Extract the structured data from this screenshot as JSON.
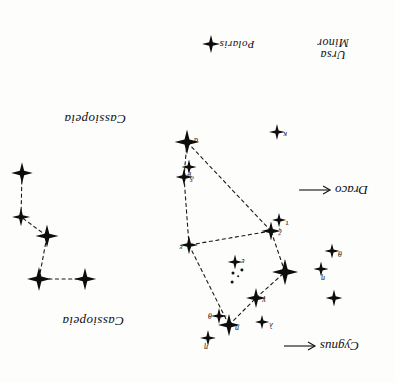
{
  "chart_data": {
    "type": "scatter",
    "orientation_note": "plate printed upside-down (rotated 180 degrees)",
    "xlim": [
      0,
      395
    ],
    "ylim": [
      0,
      382
    ],
    "grid": false,
    "legend_position": "bottom",
    "constellation_labels": [
      {
        "name": "Cassiopeia",
        "x": 302,
        "y": 61,
        "size": 13
      },
      {
        "name": "Cassiopeia",
        "x": 300,
        "y": 263,
        "size": 13
      },
      {
        "name": "Polaris",
        "x": 158,
        "y": 338,
        "size": 11
      },
      {
        "name": "Ursa Minor",
        "line1": "Ursa",
        "line2": "Minor",
        "x": 62,
        "y": 333,
        "size": 12
      }
    ],
    "direction_markers": [
      {
        "name": "Cygnus",
        "x": 74,
        "y": 36,
        "size": 13
      },
      {
        "name": "Draco",
        "x": 62,
        "y": 192,
        "size": 13
      }
    ],
    "legend_items": [
      {
        "label": "Polaris",
        "symbol": "four-point-star"
      }
    ],
    "series": [
      {
        "name": "Ursa Minor",
        "stars": [
          {
            "id": "um-polaris",
            "label": "α",
            "x": 208,
            "y": 240,
            "mag": 4.2,
            "label_dx": -9,
            "label_dy": 2
          },
          {
            "id": "um-delta",
            "label": "δ",
            "x": 211,
            "y": 205,
            "mag": 2.2,
            "label_dx": -8,
            "label_dy": -1
          },
          {
            "id": "um-epsilon",
            "label": "ε",
            "x": 206,
            "y": 137,
            "mag": 2.6,
            "label_dx": 8,
            "label_dy": -2
          },
          {
            "id": "um-zeta",
            "label": "ζ",
            "x": 124,
            "y": 151,
            "mag": 2.8,
            "label_dx": -9,
            "label_dy": 0
          },
          {
            "id": "um-beta",
            "label": "β",
            "x": 110,
            "y": 110,
            "mag": 4.6,
            "label_dx": 0,
            "label_dy": 0
          },
          {
            "id": "um-gamma",
            "label": "γ",
            "x": 139,
            "y": 84,
            "mag": 3.0,
            "label_dx": -8,
            "label_dy": -2
          },
          {
            "id": "um-eta2",
            "label": "η",
            "x": 166,
            "y": 57,
            "mag": 3.6,
            "label_dx": -8,
            "label_dy": -3
          }
        ],
        "connections": [
          [
            "um-polaris",
            "um-delta"
          ],
          [
            "um-delta",
            "um-epsilon"
          ],
          [
            "um-epsilon",
            "um-eta2"
          ],
          [
            "um-eta2",
            "um-gamma"
          ],
          [
            "um-gamma",
            "um-beta"
          ],
          [
            "um-beta",
            "um-zeta"
          ],
          [
            "um-zeta",
            "um-epsilon"
          ],
          [
            "um-zeta",
            "um-polaris"
          ]
        ]
      },
      {
        "name": "Cassiopeia",
        "stars": [
          {
            "id": "ca-1",
            "x": 310,
            "y": 103,
            "mag": 3.6
          },
          {
            "id": "ca-2",
            "x": 356,
            "y": 103,
            "mag": 4.0
          },
          {
            "id": "ca-3",
            "x": 348,
            "y": 146,
            "mag": 3.8
          },
          {
            "id": "ca-4",
            "x": 374,
            "y": 165,
            "mag": 2.6
          },
          {
            "id": "ca-5",
            "x": 373,
            "y": 209,
            "mag": 3.4
          }
        ],
        "connections": [
          [
            "ca-1",
            "ca-2"
          ],
          [
            "ca-2",
            "ca-3"
          ],
          [
            "ca-3",
            "ca-4"
          ],
          [
            "ca-4",
            "ca-5"
          ]
        ]
      },
      {
        "name": "field stars",
        "stars": [
          {
            "id": "fs-1",
            "label": "θ",
            "x": 176,
            "y": 66,
            "mag": 2.0,
            "label_dx": 9,
            "label_dy": 1
          },
          {
            "id": "fs-2",
            "label": "η",
            "x": 187,
            "y": 44,
            "mag": 2.0,
            "label_dx": 2,
            "label_dy": -9
          },
          {
            "id": "fs-3",
            "label": "λ",
            "x": 133,
            "y": 60,
            "mag": 1.6,
            "label_dx": -9,
            "label_dy": -3
          },
          {
            "id": "fs-4",
            "label": "",
            "x": 61,
            "y": 84,
            "mag": 2.2
          },
          {
            "id": "fs-5",
            "label": "η",
            "x": 74,
            "y": 113,
            "mag": 1.8,
            "label_dx": -2,
            "label_dy": -9
          },
          {
            "id": "fs-6",
            "label": "θ",
            "x": 63,
            "y": 131,
            "mag": 1.8,
            "label_dx": -8,
            "label_dy": -2
          },
          {
            "id": "fs-7",
            "label": "τ",
            "x": 116,
            "y": 162,
            "mag": 1.6,
            "label_dx": -8,
            "label_dy": -3
          },
          {
            "id": "fs-8",
            "label": "κ",
            "x": 118,
            "y": 250,
            "mag": 2.0,
            "label_dx": -8,
            "label_dy": -2
          },
          {
            "id": "fs-9",
            "label": "μ",
            "x": 206,
            "y": 215,
            "mag": 1.8,
            "label_dx": 0,
            "label_dy": -9
          },
          {
            "id": "fs-10",
            "label": "ε",
            "x": 160,
            "y": 120,
            "mag": 1.7,
            "label_dx": -8,
            "label_dy": 1
          }
        ],
        "connections": []
      },
      {
        "name": "faint cluster",
        "faint_stars": [
          {
            "x": 163,
            "y": 100,
            "r": 1.6
          },
          {
            "x": 162,
            "y": 109,
            "r": 1.5
          },
          {
            "x": 153,
            "y": 112,
            "r": 1.4
          },
          {
            "x": 157,
            "y": 106,
            "r": 1.2
          }
        ]
      }
    ]
  }
}
